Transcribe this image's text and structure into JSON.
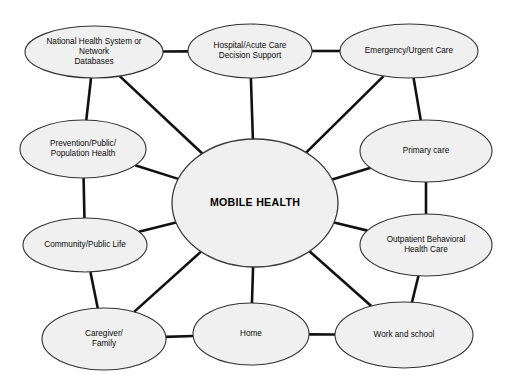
{
  "diagram": {
    "type": "hub-and-spoke-network",
    "hub": {
      "id": "mobile-health",
      "label": "MOBILE HEALTH",
      "cx": 255,
      "cy": 203,
      "rx": 83,
      "ry": 64
    },
    "colors": {
      "node_fill": "#f0f0f0",
      "node_stroke": "#333333",
      "edge": "#111111",
      "text": "#0a0a0a",
      "background": "#ffffff"
    },
    "nodes": [
      {
        "id": "national-health-system",
        "lines": [
          "National Health System or",
          "Network",
          "Databases"
        ],
        "cx": 94,
        "cy": 52,
        "rx": 69,
        "ry": 26
      },
      {
        "id": "hospital-acute-care",
        "lines": [
          "Hospital/Acute Care",
          "Decision Support"
        ],
        "cx": 250,
        "cy": 51,
        "rx": 62,
        "ry": 27
      },
      {
        "id": "emergency-urgent-care",
        "lines": [
          "Emergency/Urgent Care"
        ],
        "cx": 409,
        "cy": 51,
        "rx": 69,
        "ry": 27
      },
      {
        "id": "primary-care",
        "lines": [
          "Primary care"
        ],
        "cx": 426,
        "cy": 151,
        "rx": 66,
        "ry": 31
      },
      {
        "id": "outpatient-behavioral-health-care",
        "lines": [
          "Outpatient Behavioral",
          "Health Care"
        ],
        "cx": 426,
        "cy": 245,
        "rx": 66,
        "ry": 31
      },
      {
        "id": "work-and-school",
        "lines": [
          "Work and school"
        ],
        "cx": 404,
        "cy": 335,
        "rx": 69,
        "ry": 33
      },
      {
        "id": "home",
        "lines": [
          "Home"
        ],
        "cx": 251,
        "cy": 334,
        "rx": 58,
        "ry": 31
      },
      {
        "id": "caregiver-family",
        "lines": [
          "Caregiver/",
          "Family"
        ],
        "cx": 104,
        "cy": 339,
        "rx": 62,
        "ry": 31
      },
      {
        "id": "community-public-life",
        "lines": [
          "Community/Public Life"
        ],
        "cx": 85,
        "cy": 245,
        "rx": 62,
        "ry": 27
      },
      {
        "id": "prevention-public-population-health",
        "lines": [
          "Prevention/Public/",
          "Population Health"
        ],
        "cx": 83,
        "cy": 149,
        "rx": 63,
        "ry": 29
      }
    ],
    "edges": [
      {
        "id": "edge-hub-national-health",
        "from": "mobile-health",
        "to": "national-health-system"
      },
      {
        "id": "edge-hub-hospital",
        "from": "mobile-health",
        "to": "hospital-acute-care"
      },
      {
        "id": "edge-hub-emergency",
        "from": "mobile-health",
        "to": "emergency-urgent-care"
      },
      {
        "id": "edge-hub-primary-care",
        "from": "mobile-health",
        "to": "primary-care"
      },
      {
        "id": "edge-hub-outpatient",
        "from": "mobile-health",
        "to": "outpatient-behavioral-health-care"
      },
      {
        "id": "edge-hub-work-school",
        "from": "mobile-health",
        "to": "work-and-school"
      },
      {
        "id": "edge-hub-home",
        "from": "mobile-health",
        "to": "home"
      },
      {
        "id": "edge-hub-caregiver",
        "from": "mobile-health",
        "to": "caregiver-family"
      },
      {
        "id": "edge-hub-community",
        "from": "mobile-health",
        "to": "community-public-life"
      },
      {
        "id": "edge-hub-prevention",
        "from": "mobile-health",
        "to": "prevention-public-population-health"
      },
      {
        "id": "edge-national-health-hospital",
        "from": "national-health-system",
        "to": "hospital-acute-care"
      },
      {
        "id": "edge-hospital-emergency",
        "from": "hospital-acute-care",
        "to": "emergency-urgent-care"
      },
      {
        "id": "edge-emergency-primary-care",
        "from": "emergency-urgent-care",
        "to": "primary-care"
      },
      {
        "id": "edge-primary-care-outpatient",
        "from": "primary-care",
        "to": "outpatient-behavioral-health-care"
      },
      {
        "id": "edge-outpatient-work-school",
        "from": "outpatient-behavioral-health-care",
        "to": "work-and-school"
      },
      {
        "id": "edge-work-school-home",
        "from": "work-and-school",
        "to": "home"
      },
      {
        "id": "edge-home-caregiver",
        "from": "home",
        "to": "caregiver-family"
      },
      {
        "id": "edge-caregiver-community",
        "from": "caregiver-family",
        "to": "community-public-life"
      },
      {
        "id": "edge-community-prevention",
        "from": "community-public-life",
        "to": "prevention-public-population-health"
      },
      {
        "id": "edge-prevention-national-health",
        "from": "prevention-public-population-health",
        "to": "national-health-system"
      }
    ]
  }
}
